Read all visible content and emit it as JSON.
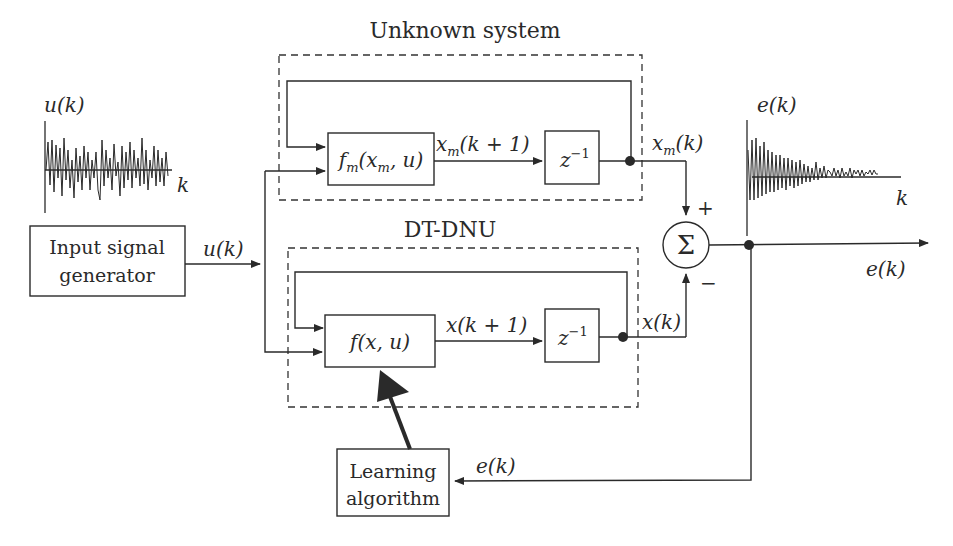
{
  "diagram": {
    "unknown_system": {
      "label": "Unknown system",
      "block_fm": "fm(xm, u)",
      "block_fm_main": "f",
      "block_fm_sub": "m",
      "block_fm_args": "(x",
      "block_fm_args_sub": "m",
      "block_fm_args_end": ", u)",
      "delay": "z",
      "delay_exp": "−1",
      "signal_next": "x",
      "signal_next_sub": "m",
      "signal_next_args": "(k + 1)",
      "output": "x",
      "output_sub": "m",
      "output_args": "(k)"
    },
    "dtdnu": {
      "label": "DT-DNU",
      "block_f": "f(x, u)",
      "delay": "z",
      "delay_exp": "−1",
      "signal_next": "x(k + 1)",
      "output": "x(k)"
    },
    "input_generator": {
      "line1": "Input signal",
      "line2": "generator",
      "output": "u(k)"
    },
    "input_plot": {
      "ylabel": "u(k)",
      "xlabel": "k"
    },
    "summer": {
      "symbol": "Σ",
      "plus": "+",
      "minus": "−"
    },
    "error_plot": {
      "ylabel": "e(k)",
      "xlabel": "k"
    },
    "error_output": "e(k)",
    "learning": {
      "line1": "Learning",
      "line2": "algorithm",
      "input": "e(k)"
    },
    "colors": {
      "line": "#2a2a2a",
      "background": "#ffffff"
    }
  }
}
